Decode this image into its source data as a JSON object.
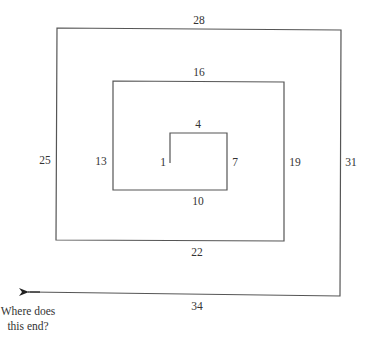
{
  "diagram": {
    "type": "spiral",
    "line_color": "#555555",
    "segments": [
      {
        "label": "1",
        "side": "left"
      },
      {
        "label": "4",
        "side": "top"
      },
      {
        "label": "7",
        "side": "right"
      },
      {
        "label": "10",
        "side": "bottom"
      },
      {
        "label": "13",
        "side": "left"
      },
      {
        "label": "16",
        "side": "top"
      },
      {
        "label": "19",
        "side": "right"
      },
      {
        "label": "22",
        "side": "bottom"
      },
      {
        "label": "25",
        "side": "left"
      },
      {
        "label": "28",
        "side": "top"
      },
      {
        "label": "31",
        "side": "right"
      },
      {
        "label": "34",
        "side": "bottom"
      }
    ],
    "question_line1": "Where does",
    "question_line2": "this end?"
  }
}
